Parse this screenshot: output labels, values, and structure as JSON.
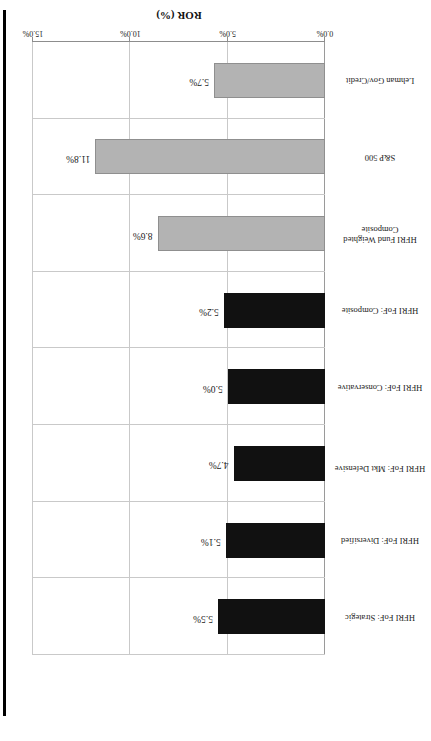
{
  "chart_data": {
    "type": "bar",
    "orientation": "horizontal",
    "title": "",
    "xlabel": "ROR (%)",
    "ylabel": "",
    "xlim": [
      0.0,
      15.0
    ],
    "xticks": [
      "0.0%",
      "5.0%",
      "10.0%",
      "15.0%"
    ],
    "xtick_values": [
      0.0,
      5.0,
      10.0,
      15.0
    ],
    "grid": true,
    "legend": "none",
    "categories": [
      "HFRI FoF: Strategic",
      "HFRI FoF: Diversified",
      "HFRI FoF: Mkt Defensive",
      "HFRI FoF: Conservative",
      "HFRI FoF: Composite",
      "HFRI Fund Weighted Composite",
      "S&P 500",
      "Lehman Gov/Credit"
    ],
    "values": [
      5.5,
      5.1,
      4.7,
      5.0,
      5.2,
      8.6,
      11.8,
      5.7
    ],
    "value_labels": [
      "5.5%",
      "5.1%",
      "4.7%",
      "5.0%",
      "5.2%",
      "8.6%",
      "11.8%",
      "5.7%"
    ],
    "series_colors": [
      "#111111",
      "#111111",
      "#111111",
      "#111111",
      "#111111",
      "#b3b3b3",
      "#b3b3b3",
      "#b3b3b3"
    ],
    "colors": {
      "dark_bar": "#111111",
      "light_bar": "#b3b3b3",
      "gridline": "#c9c9c9",
      "axis": "#8d8d8d",
      "text": "#1a1a1a",
      "background": "#ffffff",
      "scan_edge": "#000000"
    }
  },
  "page": {
    "rotation_note": "180",
    "axis_title": "ROR (%)"
  }
}
